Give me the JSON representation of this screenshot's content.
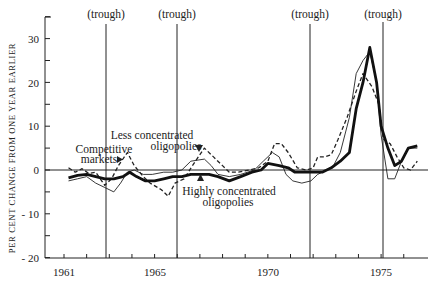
{
  "chart_data": {
    "type": "line",
    "title": "",
    "xlabel": "",
    "ylabel": "PER CENT CHANGE FROM ONE YEAR EARLIER",
    "xlim": [
      1960.5,
      1976.8
    ],
    "ylim": [
      -20,
      35
    ],
    "x_ticks": [
      1961,
      1962,
      1963,
      1964,
      1965,
      1966,
      1967,
      1968,
      1969,
      1970,
      1971,
      1972,
      1973,
      1974,
      1975,
      1976
    ],
    "x_tick_labels": [
      "1961",
      "1965",
      "1970",
      "1975"
    ],
    "x_tick_label_years": [
      1961,
      1965,
      1970,
      1975
    ],
    "y_ticks": [
      -20,
      -15,
      -10,
      -5,
      0,
      5,
      10,
      15,
      20,
      25,
      30,
      35
    ],
    "y_tick_labels": [
      "- 20",
      "- 10",
      "0",
      "10",
      "20",
      "30"
    ],
    "y_tick_label_values": [
      -20,
      -10,
      0,
      10,
      20,
      30
    ],
    "grid": false,
    "zero_line": true,
    "vertical_markers": [
      {
        "x": 1962.85,
        "label": "(trough)"
      },
      {
        "x": 1966.0,
        "label": "(trough)"
      },
      {
        "x": 1971.9,
        "label": "(trough)"
      },
      {
        "x": 1975.1,
        "label": "(trough)"
      }
    ],
    "series": [
      {
        "name": "Competitive markets",
        "style": "dashed",
        "points": [
          [
            1961.2,
            0.5
          ],
          [
            1961.5,
            -0.5
          ],
          [
            1961.8,
            0.3
          ],
          [
            1962.1,
            -0.8
          ],
          [
            1962.4,
            -0.5
          ],
          [
            1962.8,
            -3.5
          ],
          [
            1963.1,
            -2
          ],
          [
            1963.4,
            1
          ],
          [
            1963.8,
            4
          ],
          [
            1964.1,
            1
          ],
          [
            1964.5,
            -1.5
          ],
          [
            1964.8,
            -3
          ],
          [
            1965.3,
            -4.5
          ],
          [
            1965.6,
            -6
          ],
          [
            1965.9,
            -3
          ],
          [
            1966.3,
            -2
          ],
          [
            1966.8,
            2
          ],
          [
            1967.2,
            5
          ],
          [
            1967.6,
            3
          ],
          [
            1968.0,
            1
          ],
          [
            1968.3,
            -0.5
          ],
          [
            1968.7,
            -0.5
          ],
          [
            1969.2,
            0
          ],
          [
            1969.6,
            0.5
          ],
          [
            1970.0,
            2
          ],
          [
            1970.3,
            6
          ],
          [
            1970.6,
            6
          ],
          [
            1970.9,
            4
          ],
          [
            1971.3,
            0.5
          ],
          [
            1971.7,
            0
          ],
          [
            1972.0,
            0.5
          ],
          [
            1972.2,
            3
          ],
          [
            1972.5,
            3
          ],
          [
            1972.8,
            3.5
          ],
          [
            1973.1,
            7
          ],
          [
            1973.5,
            12
          ],
          [
            1973.9,
            18
          ],
          [
            1974.2,
            22
          ],
          [
            1974.6,
            19
          ],
          [
            1974.9,
            15
          ],
          [
            1975.1,
            7
          ],
          [
            1975.4,
            6
          ],
          [
            1975.7,
            3
          ],
          [
            1976.0,
            0.5
          ],
          [
            1976.3,
            0
          ],
          [
            1976.6,
            2
          ]
        ]
      },
      {
        "name": "Less concentrated oligopolies",
        "style": "thin",
        "points": [
          [
            1961.2,
            -2.5
          ],
          [
            1961.6,
            -2
          ],
          [
            1962.0,
            -1.5
          ],
          [
            1962.4,
            -3
          ],
          [
            1962.8,
            -4
          ],
          [
            1963.2,
            -5
          ],
          [
            1963.5,
            -3
          ],
          [
            1963.8,
            -0.5
          ],
          [
            1964.1,
            0
          ],
          [
            1964.5,
            -1
          ],
          [
            1964.9,
            -1
          ],
          [
            1965.4,
            -0.5
          ],
          [
            1965.8,
            -0.5
          ],
          [
            1966.2,
            0
          ],
          [
            1966.6,
            2
          ],
          [
            1066.9,
            3
          ],
          [
            1967.2,
            2.5
          ],
          [
            1967.5,
            1
          ],
          [
            1967.8,
            -1
          ],
          [
            1968.3,
            -1.5
          ],
          [
            1968.8,
            -1
          ],
          [
            1969.4,
            0
          ],
          [
            1969.8,
            2
          ],
          [
            1970.2,
            4
          ],
          [
            1970.5,
            3
          ],
          [
            1970.8,
            -1
          ],
          [
            1971.1,
            -2.5
          ],
          [
            1971.5,
            -3
          ],
          [
            1971.9,
            -2.5
          ],
          [
            1972.2,
            -1
          ],
          [
            1972.6,
            0
          ],
          [
            1972.9,
            1
          ],
          [
            1973.2,
            4
          ],
          [
            1973.6,
            12
          ],
          [
            1973.9,
            22
          ],
          [
            1974.2,
            25
          ],
          [
            1974.5,
            27
          ],
          [
            1974.8,
            20
          ],
          [
            1975.0,
            8
          ],
          [
            1975.3,
            -2
          ],
          [
            1975.6,
            -2
          ],
          [
            1975.9,
            2
          ],
          [
            1976.2,
            5
          ],
          [
            1976.6,
            5
          ]
        ]
      },
      {
        "name": "Highly concentrated oligopolies",
        "style": "thick",
        "points": [
          [
            1961.2,
            -1.8
          ],
          [
            1961.6,
            -1.2
          ],
          [
            1962.0,
            -1.0
          ],
          [
            1962.4,
            -1.5
          ],
          [
            1962.8,
            -2
          ],
          [
            1963.2,
            -2
          ],
          [
            1963.6,
            -1.5
          ],
          [
            1963.9,
            -0.5
          ],
          [
            1964.2,
            -1.5
          ],
          [
            1964.6,
            -2.5
          ],
          [
            1965.0,
            -2.5
          ],
          [
            1965.4,
            -2
          ],
          [
            1965.8,
            -1.5
          ],
          [
            1966.2,
            -1.5
          ],
          [
            1966.6,
            -1
          ],
          [
            1967.0,
            -1
          ],
          [
            1967.4,
            -1
          ],
          [
            1967.8,
            -1.5
          ],
          [
            1968.3,
            -2.5
          ],
          [
            1968.8,
            -1.5
          ],
          [
            1969.3,
            -0.5
          ],
          [
            1969.7,
            0
          ],
          [
            1970.0,
            1.5
          ],
          [
            1970.5,
            1
          ],
          [
            1970.9,
            0.5
          ],
          [
            1971.2,
            -0.5
          ],
          [
            1971.6,
            -0.5
          ],
          [
            1972.0,
            -0.5
          ],
          [
            1972.4,
            -0.5
          ],
          [
            1972.8,
            0.5
          ],
          [
            1973.2,
            2
          ],
          [
            1973.6,
            4
          ],
          [
            1973.9,
            14
          ],
          [
            1974.2,
            20
          ],
          [
            1974.5,
            28
          ],
          [
            1974.8,
            20
          ],
          [
            1975.0,
            10
          ],
          [
            1975.3,
            5
          ],
          [
            1975.6,
            1
          ],
          [
            1975.9,
            2
          ],
          [
            1976.2,
            5
          ],
          [
            1976.6,
            5.5
          ]
        ]
      }
    ],
    "annotations": [
      {
        "text": [
          "Competitive",
          "markets"
        ],
        "marker": "right-triangle",
        "target_series": "Competitive markets"
      },
      {
        "text": [
          "Less concentrated",
          "oligopolies"
        ],
        "marker": "down-triangle",
        "target_series": "Less concentrated oligopolies"
      },
      {
        "text": [
          "Highly concentrated",
          "oligopolies"
        ],
        "marker": "up-triangle",
        "target_series": "Highly concentrated oligopolies"
      }
    ]
  },
  "labels": {
    "ylabel": "PER CENT CHANGE FROM ONE YEAR EARLIER",
    "trough": "(trough)",
    "competitive_1": "Competitive",
    "competitive_2": "markets",
    "less_1": "Less concentrated",
    "less_2": "oligopolies",
    "highly_1": "Highly concentrated",
    "highly_2": "oligopolies",
    "x_1961": "1961",
    "x_1965": "1965",
    "x_1970": "1970",
    "x_1975": "1975",
    "y_30": "30",
    "y_20": "20",
    "y_10": "10",
    "y_0": "0",
    "y_m10": "- 10",
    "y_m20": "- 20"
  }
}
